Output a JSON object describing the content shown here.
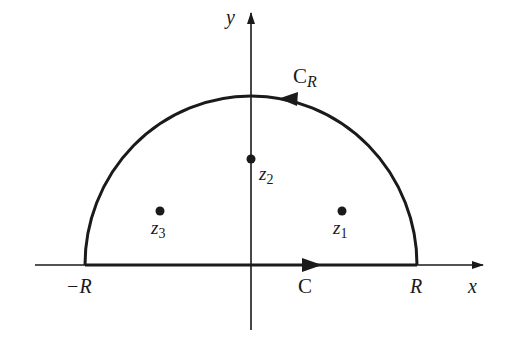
{
  "diagram": {
    "type": "contour-semicircle",
    "axes": {
      "x_label": "x",
      "y_label": "y"
    },
    "contour": {
      "arc_label": "C",
      "arc_label_sub": "R",
      "segment_label": "C",
      "left_endpoint_label": "−R",
      "right_endpoint_label": "R"
    },
    "points": [
      {
        "name": "z",
        "sub": "1"
      },
      {
        "name": "z",
        "sub": "2"
      },
      {
        "name": "z",
        "sub": "3"
      }
    ],
    "colors": {
      "stroke": "#1a1a1a",
      "background": "#ffffff"
    }
  }
}
